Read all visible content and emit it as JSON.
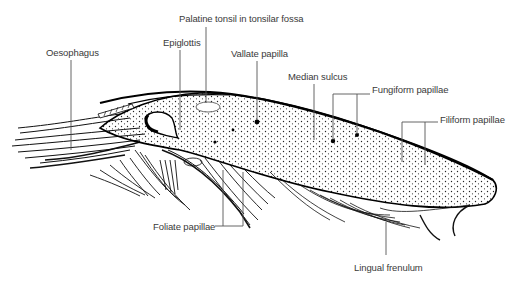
{
  "diagram": {
    "labels": [
      {
        "id": "oesophagus",
        "text": "Oesophagus",
        "x": 46,
        "y": 47
      },
      {
        "id": "epiglottis",
        "text": "Epiglottis",
        "x": 163,
        "y": 37
      },
      {
        "id": "palatine-tonsil",
        "text": "Palatine tonsil in tonsilar fossa",
        "x": 179,
        "y": 13
      },
      {
        "id": "vallate-papilla",
        "text": "Vallate papilla",
        "x": 231,
        "y": 48
      },
      {
        "id": "median-sulcus",
        "text": "Median sulcus",
        "x": 288,
        "y": 71
      },
      {
        "id": "fungiform-papillae",
        "text": "Fungiform papillae",
        "x": 372,
        "y": 84
      },
      {
        "id": "filiform-papillae",
        "text": "Filiform papillae",
        "x": 440,
        "y": 114
      },
      {
        "id": "foliate-papillae",
        "text": "Foliate papillae",
        "x": 153,
        "y": 222
      },
      {
        "id": "lingual-frenulum",
        "text": "Lingual frenulum",
        "x": 354,
        "y": 262
      }
    ]
  }
}
